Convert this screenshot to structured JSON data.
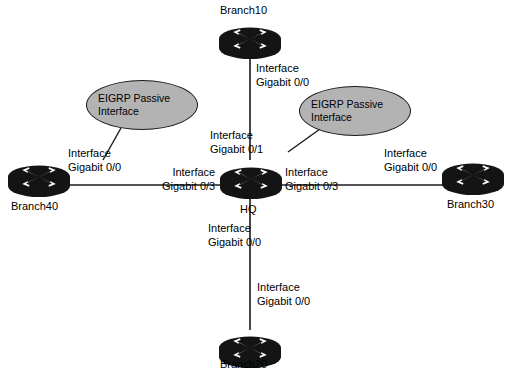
{
  "diagram": {
    "background_color": "#ffffff",
    "line_color": "#1a1a1a",
    "router_color": "#141414",
    "callout_fill": "#b3b3b3"
  },
  "nodes": [
    {
      "id": "branch10",
      "label": "Branch10",
      "icon": "router-icon"
    },
    {
      "id": "hq",
      "label": "HQ",
      "icon": "router-icon"
    },
    {
      "id": "branch40",
      "label": "Branch40",
      "icon": "router-icon"
    },
    {
      "id": "branch30",
      "label": "Branch30",
      "icon": "router-icon"
    },
    {
      "id": "branch20",
      "label": "Branch20",
      "icon": "router-icon"
    }
  ],
  "interface_labels": [
    {
      "id": "branch10_g00",
      "line1": "Interface",
      "line2": "Gigabit 0/0"
    },
    {
      "id": "hq_g01",
      "line1": "Interface",
      "line2": "Gigabit 0/1"
    },
    {
      "id": "branch40_g00",
      "line1": "Interface",
      "line2": "Gigabit 0/0"
    },
    {
      "id": "hq_g03_left",
      "line1": "Interface",
      "line2": "Gigabit 0/3"
    },
    {
      "id": "hq_g03_right",
      "line1": "Interface",
      "line2": "Gigabit 0/3"
    },
    {
      "id": "branch30_g00",
      "line1": "Interface",
      "line2": "Gigabit 0/0"
    },
    {
      "id": "hq_g00_down",
      "line1": "Interface",
      "line2": "Gigabit 0/0"
    },
    {
      "id": "branch20_g00",
      "line1": "Interface",
      "line2": "Gigabit 0/0"
    }
  ],
  "callouts": [
    {
      "id": "callout_left",
      "line1": "EIGRP Passive",
      "line2": "Interface"
    },
    {
      "id": "callout_right",
      "line1": "EIGRP Passive",
      "line2": "Interface"
    }
  ]
}
